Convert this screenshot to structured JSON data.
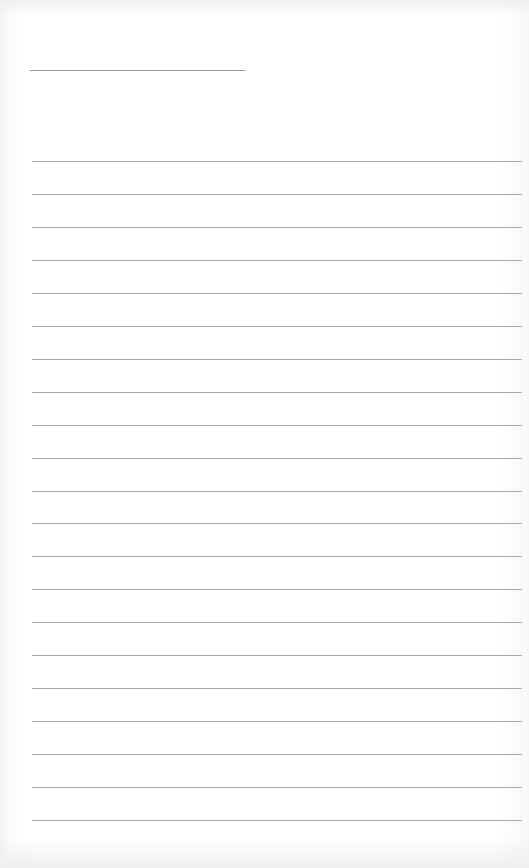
{
  "page": {
    "type": "lined-paper",
    "background_color": "#ffffff",
    "line_color": "#a8a8a8",
    "header_line": {
      "x": 30,
      "y": 70,
      "width": 215
    },
    "ruled_lines": {
      "count": 21,
      "first_y": 161,
      "spacing": 32.95,
      "x": 32,
      "width": 490
    }
  }
}
